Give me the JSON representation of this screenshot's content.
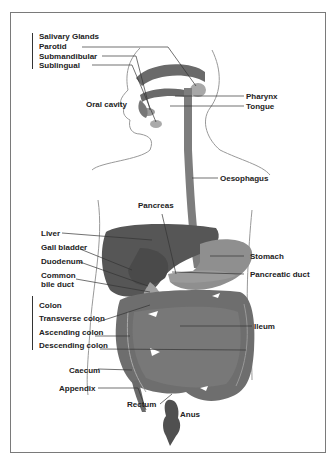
{
  "diagram": {
    "groups": {
      "salivary": {
        "heading": "Salivary Glands",
        "items": [
          "Parotid",
          "Submandibular",
          "Sublingual"
        ]
      },
      "colon": {
        "heading": "Colon",
        "items": [
          "Transverse colon",
          "Ascending colon",
          "Descending colon"
        ]
      }
    },
    "labels": {
      "oral_cavity": "Oral cavity",
      "pharynx": "Pharynx",
      "tongue": "Tongue",
      "oesophagus": "Oesophagus",
      "pancreas": "Pancreas",
      "liver": "Liver",
      "gall_bladder": "Gall bladder",
      "duodenum": "Duodenum",
      "common_bile_duct_1": "Common",
      "common_bile_duct_2": "bile duct",
      "stomach": "Stomach",
      "pancreatic_duct": "Pancreatic duct",
      "ileum": "Ileum",
      "caecum": "Caecum",
      "appendix": "Appendix",
      "rectum": "Rectum",
      "anus": "Anus"
    },
    "colors": {
      "organ_dark": "#5a5a5a",
      "organ_mid": "#7d7d7d",
      "organ_light": "#9a9a9a",
      "outline": "#8a8a8a",
      "leader": "#333333",
      "border": "#7a7a7a"
    }
  }
}
